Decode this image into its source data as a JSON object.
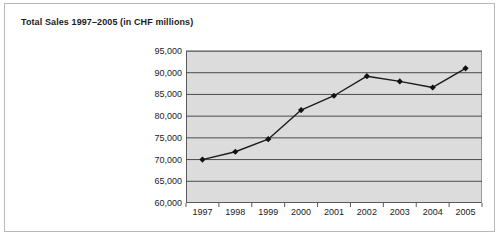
{
  "chart_data": {
    "type": "line",
    "title": "Total Sales 1997–2005 (in CHF millions)",
    "xlabel": "",
    "ylabel": "",
    "categories": [
      "1997",
      "1998",
      "1999",
      "2000",
      "2001",
      "2002",
      "2003",
      "2004",
      "2005"
    ],
    "values": [
      70000,
      71800,
      74700,
      81400,
      84700,
      89200,
      88000,
      86600,
      91000
    ],
    "series": [
      {
        "name": "Total Sales",
        "values": [
          70000,
          71800,
          74700,
          81400,
          84700,
          89200,
          88000,
          86600,
          91000
        ]
      }
    ],
    "ylim": [
      60000,
      95000
    ],
    "ytick_step": 5000,
    "ytick_labels": [
      "95,000",
      "90,000",
      "85,000",
      "80,000",
      "75,000",
      "70,000",
      "65,000",
      "60,000"
    ],
    "ytick_values": [
      95000,
      90000,
      85000,
      80000,
      75000,
      70000,
      65000,
      60000
    ],
    "grid": true,
    "grid_axis": "y",
    "legend": false,
    "legend_position": "none",
    "marker": "diamond",
    "units": "CHF millions",
    "colors": {
      "plot_background": "#dcdcdc",
      "gridline": "#4a4a4a",
      "series_line": "#1b1b1b",
      "marker": "#111111",
      "axis": "#5a5a5a",
      "frame_border": "#b9b9b9",
      "page_background": "#ffffff",
      "text": "#1b1b1b"
    }
  }
}
